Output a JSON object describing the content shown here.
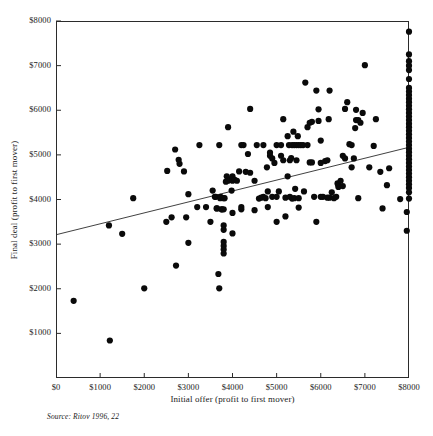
{
  "chart_data": {
    "type": "scatter",
    "title": "",
    "xlabel": "Initial offer (profit to first mover)",
    "ylabel": "Final deal (profit to first mover)",
    "source": "Source: Ritov 1996, 22",
    "xlim": [
      0,
      8000
    ],
    "ylim": [
      0,
      8000
    ],
    "grid": false,
    "legend": null,
    "xticks": [
      0,
      1000,
      2000,
      3000,
      4000,
      5000,
      6000,
      7000,
      8000
    ],
    "xtick_labels": [
      "$0",
      "$1000",
      "$2000",
      "$3000",
      "$4000",
      "$5000",
      "$6000",
      "$7000",
      "$8000"
    ],
    "yticks": [
      1000,
      2000,
      3000,
      4000,
      5000,
      6000,
      7000,
      8000
    ],
    "ytick_labels": [
      "$1000",
      "$2000",
      "$3000",
      "$4000",
      "$5000",
      "$6000",
      "$7000",
      "$8000"
    ],
    "point_color": "#0a0a0a",
    "point_radius_px": 3.1,
    "line_color": "#2b2b2b",
    "regression_line": {
      "x": [
        0,
        8000
      ],
      "y": [
        3210,
        5170
      ]
    },
    "points": [
      [
        400,
        1730
      ],
      [
        1220,
        840
      ],
      [
        1200,
        3420
      ],
      [
        1500,
        3230
      ],
      [
        1750,
        4030
      ],
      [
        2000,
        2010
      ],
      [
        2500,
        3500
      ],
      [
        2520,
        4640
      ],
      [
        2620,
        3600
      ],
      [
        2700,
        5120
      ],
      [
        2720,
        2520
      ],
      [
        2780,
        4890
      ],
      [
        2800,
        4800
      ],
      [
        2900,
        4630
      ],
      [
        2950,
        3600
      ],
      [
        3000,
        3030
      ],
      [
        3000,
        4120
      ],
      [
        3200,
        3830
      ],
      [
        3250,
        5220
      ],
      [
        3400,
        3830
      ],
      [
        3500,
        3500
      ],
      [
        3550,
        4200
      ],
      [
        3600,
        4060
      ],
      [
        3620,
        4060
      ],
      [
        3640,
        3800
      ],
      [
        3650,
        3800
      ],
      [
        3680,
        2330
      ],
      [
        3700,
        2010
      ],
      [
        3700,
        5220
      ],
      [
        3720,
        4030
      ],
      [
        3730,
        4060
      ],
      [
        3750,
        3780
      ],
      [
        3760,
        3780
      ],
      [
        3800,
        2790
      ],
      [
        3800,
        2880
      ],
      [
        3800,
        2960
      ],
      [
        3800,
        3050
      ],
      [
        3800,
        3320
      ],
      [
        3800,
        3420
      ],
      [
        3800,
        3780
      ],
      [
        3800,
        4030
      ],
      [
        3820,
        4030
      ],
      [
        3850,
        4400
      ],
      [
        3870,
        4520
      ],
      [
        3900,
        4420
      ],
      [
        3900,
        5620
      ],
      [
        3950,
        4440
      ],
      [
        3980,
        4200
      ],
      [
        4000,
        3240
      ],
      [
        4000,
        3700
      ],
      [
        4000,
        4420
      ],
      [
        4000,
        4440
      ],
      [
        4000,
        4520
      ],
      [
        4050,
        4440
      ],
      [
        4100,
        4420
      ],
      [
        4150,
        4630
      ],
      [
        4200,
        3780
      ],
      [
        4200,
        3830
      ],
      [
        4200,
        5220
      ],
      [
        4250,
        5220
      ],
      [
        4300,
        4620
      ],
      [
        4350,
        5020
      ],
      [
        4400,
        4600
      ],
      [
        4400,
        6030
      ],
      [
        4500,
        3760
      ],
      [
        4500,
        4420
      ],
      [
        4550,
        5220
      ],
      [
        4600,
        4020
      ],
      [
        4650,
        4040
      ],
      [
        4700,
        4060
      ],
      [
        4700,
        5220
      ],
      [
        4750,
        4030
      ],
      [
        4780,
        4720
      ],
      [
        4800,
        3830
      ],
      [
        4800,
        4180
      ],
      [
        4850,
        4980
      ],
      [
        4850,
        5050
      ],
      [
        4900,
        4060
      ],
      [
        4900,
        4920
      ],
      [
        4950,
        4820
      ],
      [
        5000,
        3500
      ],
      [
        5000,
        4060
      ],
      [
        5000,
        5220
      ],
      [
        5050,
        4180
      ],
      [
        5100,
        4980
      ],
      [
        5100,
        5220
      ],
      [
        5150,
        4880
      ],
      [
        5150,
        5800
      ],
      [
        5200,
        3620
      ],
      [
        5200,
        4040
      ],
      [
        5250,
        4520
      ],
      [
        5250,
        5420
      ],
      [
        5280,
        5220
      ],
      [
        5300,
        4060
      ],
      [
        5300,
        4880
      ],
      [
        5330,
        4930
      ],
      [
        5350,
        4020
      ],
      [
        5350,
        5220
      ],
      [
        5380,
        5520
      ],
      [
        5400,
        4030
      ],
      [
        5400,
        5220
      ],
      [
        5420,
        4240
      ],
      [
        5450,
        4880
      ],
      [
        5450,
        5220
      ],
      [
        5480,
        5420
      ],
      [
        5500,
        3820
      ],
      [
        5500,
        4030
      ],
      [
        5500,
        5220
      ],
      [
        5550,
        5220
      ],
      [
        5600,
        5220
      ],
      [
        5620,
        4180
      ],
      [
        5650,
        6620
      ],
      [
        5700,
        5220
      ],
      [
        5700,
        5620
      ],
      [
        5750,
        5720
      ],
      [
        5750,
        4830
      ],
      [
        5800,
        4830
      ],
      [
        5800,
        5740
      ],
      [
        5850,
        4060
      ],
      [
        5900,
        3500
      ],
      [
        5900,
        6440
      ],
      [
        5950,
        5760
      ],
      [
        5950,
        6020
      ],
      [
        6000,
        4060
      ],
      [
        6000,
        4820
      ],
      [
        6000,
        5320
      ],
      [
        6050,
        4060
      ],
      [
        6100,
        4860
      ],
      [
        6150,
        4040
      ],
      [
        6150,
        4880
      ],
      [
        6180,
        5800
      ],
      [
        6200,
        4040
      ],
      [
        6200,
        6440
      ],
      [
        6250,
        4160
      ],
      [
        6300,
        4030
      ],
      [
        6350,
        4060
      ],
      [
        6380,
        4360
      ],
      [
        6400,
        4280
      ],
      [
        6400,
        4320
      ],
      [
        6450,
        4420
      ],
      [
        6500,
        4300
      ],
      [
        6500,
        4980
      ],
      [
        6550,
        4920
      ],
      [
        6550,
        6030
      ],
      [
        6600,
        6180
      ],
      [
        6650,
        5240
      ],
      [
        6700,
        4720
      ],
      [
        6700,
        5220
      ],
      [
        6750,
        4920
      ],
      [
        6780,
        5600
      ],
      [
        6800,
        5780
      ],
      [
        6800,
        6010
      ],
      [
        6850,
        4030
      ],
      [
        6850,
        5780
      ],
      [
        6900,
        5720
      ],
      [
        6950,
        5940
      ],
      [
        7000,
        7010
      ],
      [
        7100,
        4720
      ],
      [
        7200,
        5200
      ],
      [
        7250,
        5800
      ],
      [
        7350,
        4620
      ],
      [
        7400,
        3800
      ],
      [
        7500,
        4320
      ],
      [
        7550,
        4700
      ],
      [
        7800,
        4010
      ],
      [
        7950,
        3300
      ],
      [
        7950,
        3720
      ],
      [
        8000,
        4020
      ],
      [
        8000,
        4160
      ],
      [
        8000,
        4260
      ],
      [
        8000,
        4340
      ],
      [
        8000,
        4420
      ],
      [
        8000,
        4500
      ],
      [
        8000,
        4580
      ],
      [
        8000,
        4660
      ],
      [
        8000,
        4740
      ],
      [
        8000,
        4820
      ],
      [
        8000,
        4900
      ],
      [
        8000,
        4980
      ],
      [
        8000,
        5060
      ],
      [
        8000,
        5140
      ],
      [
        8000,
        5220
      ],
      [
        8000,
        5300
      ],
      [
        8000,
        5380
      ],
      [
        8000,
        5460
      ],
      [
        8000,
        5540
      ],
      [
        8000,
        5620
      ],
      [
        8000,
        5700
      ],
      [
        8000,
        5780
      ],
      [
        8000,
        5860
      ],
      [
        8000,
        5940
      ],
      [
        8000,
        6020
      ],
      [
        8000,
        6100
      ],
      [
        8000,
        6180
      ],
      [
        8000,
        6260
      ],
      [
        8000,
        6340
      ],
      [
        8000,
        6420
      ],
      [
        8000,
        6500
      ],
      [
        8000,
        6700
      ],
      [
        8000,
        6900
      ],
      [
        8000,
        7000
      ],
      [
        8000,
        7100
      ],
      [
        8000,
        7250
      ],
      [
        8000,
        7760
      ]
    ]
  }
}
